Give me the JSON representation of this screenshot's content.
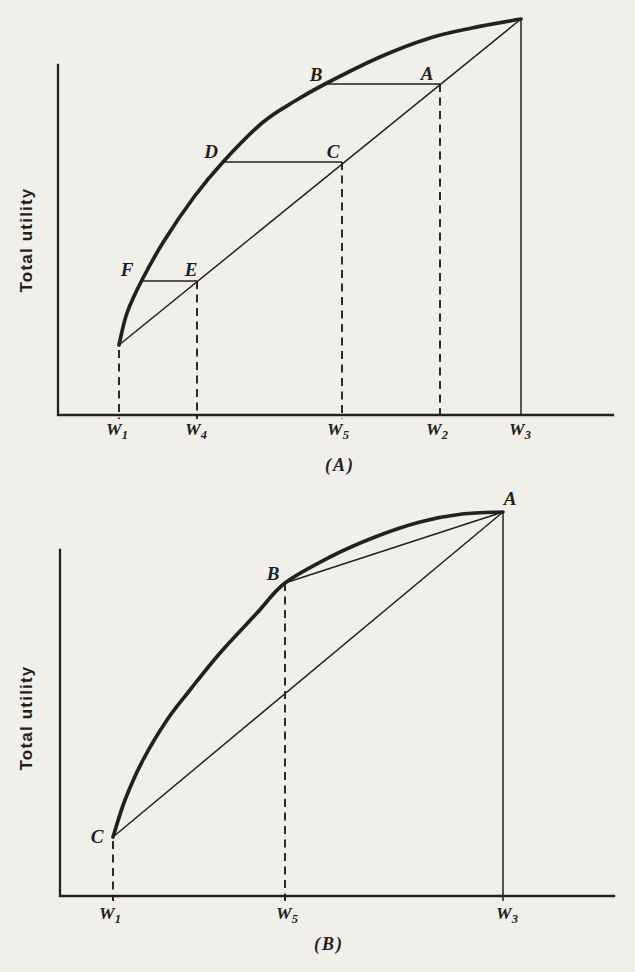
{
  "figure": {
    "kind": "scanned textbook figure",
    "panel_count": 2,
    "ink_color": "#222120",
    "paper_color": "#f1efea"
  },
  "chart_data": [
    {
      "type": "line",
      "panel": "A",
      "caption": "(A)",
      "ylabel": "Total utility",
      "description": "Concave total utility of wealth curve with chord from W1 to W3; points B, D, F on the curve and A, C, E on the chord at wealth levels W2, W5, W4.",
      "axis": {
        "x0": 58,
        "y0": 415,
        "x_end": 613,
        "y_top": 65
      },
      "utility_curve": [
        [
          119,
          345
        ],
        [
          127,
          313
        ],
        [
          142,
          280
        ],
        [
          164,
          241
        ],
        [
          194,
          197
        ],
        [
          223,
          162
        ],
        [
          262,
          123
        ],
        [
          295,
          101
        ],
        [
          325,
          84
        ],
        [
          380,
          57
        ],
        [
          430,
          38
        ],
        [
          472,
          28
        ],
        [
          521,
          19
        ]
      ],
      "chords": [
        [
          [
            119,
            345
          ],
          [
            521,
            19
          ]
        ]
      ],
      "horizontals": [
        [
          [
            141,
            281
          ],
          [
            197,
            281
          ]
        ],
        [
          [
            223,
            162
          ],
          [
            342,
            162
          ]
        ],
        [
          [
            324,
            84
          ],
          [
            440,
            84
          ]
        ]
      ],
      "dashed_verticals": [
        [
          119,
          350,
          419
        ],
        [
          197,
          281,
          419
        ],
        [
          342,
          162,
          419
        ],
        [
          440,
          84,
          419
        ]
      ],
      "solid_verticals": [
        [
          521,
          19,
          415
        ]
      ],
      "point_labels": [
        {
          "t": "B",
          "x": 316,
          "y": 81
        },
        {
          "t": "A",
          "x": 427,
          "y": 80
        },
        {
          "t": "D",
          "x": 211,
          "y": 158
        },
        {
          "t": "C",
          "x": 333,
          "y": 158
        },
        {
          "t": "F",
          "x": 127,
          "y": 276
        },
        {
          "t": "E",
          "x": 191,
          "y": 276
        }
      ],
      "x_tick_labels": [
        {
          "base": "W",
          "sub": "1",
          "x": 117
        },
        {
          "base": "W",
          "sub": "4",
          "x": 196
        },
        {
          "base": "W",
          "sub": "5",
          "x": 338
        },
        {
          "base": "W",
          "sub": "2",
          "x": 437
        },
        {
          "base": "W",
          "sub": "3",
          "x": 520
        }
      ]
    },
    {
      "type": "line",
      "panel": "B",
      "caption": "(B)",
      "ylabel": "Total utility",
      "description": "Concave total utility of wealth curve from C at W1 to A at W3 with point B on the curve at W5; straight chords drawn from C to A and from B to A.",
      "axis": {
        "x0": 60,
        "y0": 896,
        "x_end": 614,
        "y_top": 550
      },
      "utility_curve": [
        [
          113,
          837
        ],
        [
          125,
          800
        ],
        [
          143,
          760
        ],
        [
          167,
          720
        ],
        [
          190,
          690
        ],
        [
          220,
          653
        ],
        [
          257,
          613
        ],
        [
          285,
          583
        ],
        [
          330,
          557
        ],
        [
          375,
          537
        ],
        [
          420,
          522
        ],
        [
          462,
          514
        ],
        [
          503,
          512
        ]
      ],
      "chords": [
        [
          [
            113,
            837
          ],
          [
            503,
            512
          ]
        ],
        [
          [
            285,
            583
          ],
          [
            503,
            512
          ]
        ]
      ],
      "horizontals": [],
      "dashed_verticals": [
        [
          113,
          841,
          901
        ],
        [
          285,
          583,
          901
        ]
      ],
      "solid_verticals": [
        [
          503,
          512,
          901
        ]
      ],
      "point_labels": [
        {
          "t": "A",
          "x": 510,
          "y": 505
        },
        {
          "t": "B",
          "x": 273,
          "y": 580
        },
        {
          "t": "C",
          "x": 97,
          "y": 843
        }
      ],
      "x_tick_labels": [
        {
          "base": "W",
          "sub": "1",
          "x": 110
        },
        {
          "base": "W",
          "sub": "5",
          "x": 287
        },
        {
          "base": "W",
          "sub": "3",
          "x": 507
        }
      ]
    }
  ]
}
